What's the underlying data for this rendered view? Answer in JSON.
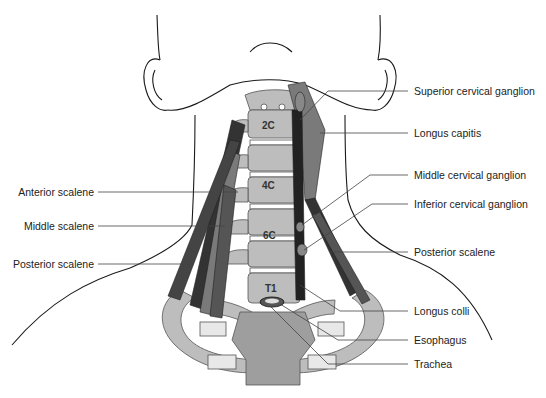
{
  "figure": {
    "colors": {
      "bone": "#bdbdbd",
      "bone_dark": "#9e9e9e",
      "muscle": "#333333",
      "muscle_light": "#7a7a7a",
      "outline": "#1a1a1a",
      "disc": "#ffffff",
      "leader": "#444444"
    }
  },
  "vertebra_labels": [
    "2C",
    "4C",
    "6C",
    "T1"
  ],
  "labels_left": [
    {
      "text": "Anterior scalene"
    },
    {
      "text": "Middle scalene"
    },
    {
      "text": "Posterior scalene"
    }
  ],
  "labels_right": [
    {
      "text": "Superior cervical ganglion"
    },
    {
      "text": "Longus capitis"
    },
    {
      "text": "Middle cervical ganglion"
    },
    {
      "text": "Inferior cervical ganglion"
    },
    {
      "text": "Posterior scalene"
    },
    {
      "text": "Longus colli"
    },
    {
      "text": "Esophagus"
    },
    {
      "text": "Trachea"
    }
  ]
}
